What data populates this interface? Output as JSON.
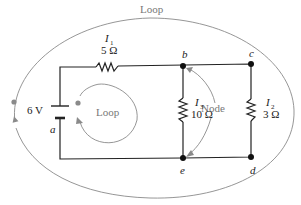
{
  "diagram": {
    "outer_loop_label": "Loop",
    "inner_loop_label": "Loop",
    "node_label": "Node",
    "battery": {
      "voltage": "6 V",
      "node": "a"
    },
    "resistors": [
      {
        "current": "I",
        "sub": "1",
        "value": "5 Ω"
      },
      {
        "current": "I",
        "sub": "3",
        "value": "10 Ω"
      },
      {
        "current": "I",
        "sub": "2",
        "value": "3 Ω"
      }
    ],
    "nodes": [
      "a",
      "b",
      "c",
      "d",
      "e"
    ],
    "colors": {
      "wire": "#222222",
      "annotation": "#8a8a8a",
      "background": "#ffffff"
    }
  }
}
